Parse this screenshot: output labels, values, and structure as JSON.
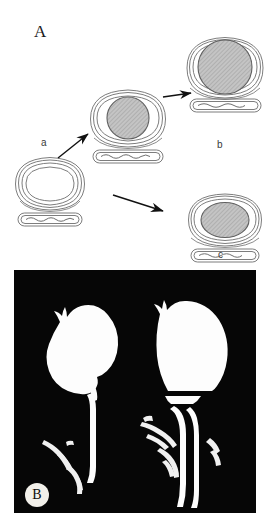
{
  "figure": {
    "background": "#ffffff",
    "panels": [
      {
        "id": "A",
        "letter": "A",
        "type": "schematic-diagram",
        "description": "Line-drawing schematic of four capsule/ring structures with hatched inclusions connected by arrows",
        "stages": [
          {
            "key": "a",
            "label": "a",
            "label_x": 41,
            "label_y": 138,
            "x": 12,
            "y": 155,
            "ring": "open",
            "core": "none",
            "core_fill": "none",
            "has_rod": true
          },
          {
            "key": "intermediate",
            "label": "",
            "x": 88,
            "y": 88,
            "ring": "open",
            "core": "circle",
            "core_fill": "#b8b8b8",
            "has_rod": true
          },
          {
            "key": "b",
            "label": "b",
            "label_x": 217,
            "label_y": 140,
            "x": 186,
            "y": 36,
            "ring": "stretched",
            "core": "large-circle",
            "core_fill": "#b8b8b8",
            "has_rod": true
          },
          {
            "key": "c",
            "label": "c",
            "label_x": 218,
            "label_y": 250,
            "x": 186,
            "y": 192,
            "ring": "open",
            "core": "ellipse",
            "core_fill": "#b8b8b8",
            "has_rod": true
          }
        ],
        "arrows": [
          {
            "name": "arrow-a-to-intermediate",
            "x1": 58,
            "y1": 158,
            "x2": 88,
            "y2": 133
          },
          {
            "name": "arrow-intermediate-to-b",
            "x1": 162,
            "y1": 96,
            "x2": 192,
            "y2": 92
          },
          {
            "name": "arrow-a-to-c",
            "x1": 112,
            "y1": 194,
            "x2": 164,
            "y2": 212
          }
        ],
        "stroke_color": "#6e6e6e",
        "hatch_color": "#8a8a8a",
        "arrow_color": "#111111"
      },
      {
        "id": "B",
        "letter": "B",
        "type": "photograph",
        "description": "Black background radiograph-style photograph showing two white organ silhouettes with tubular stalks and bright streaks",
        "background": "#060606",
        "foreground": "#ffffff",
        "x": 14,
        "y": 270,
        "width": 242,
        "height": 243,
        "badge": {
          "x": 11,
          "y": 213,
          "diameter": 24
        }
      }
    ]
  }
}
